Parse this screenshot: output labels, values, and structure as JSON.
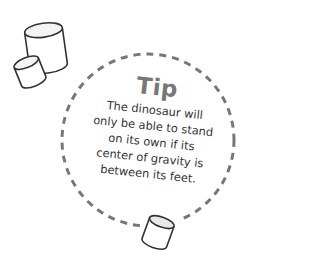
{
  "tip": {
    "title": "Tip",
    "lines": [
      "The dinosaur will",
      "only be able to stand",
      "on its own if its",
      "center of gravity is",
      "between its feet."
    ]
  },
  "colors": {
    "dashed_circle": "#777777",
    "title": "#777777",
    "body_text": "#333333",
    "outline": "#333333"
  },
  "icons": [
    "marshmallow-large",
    "marshmallow-small",
    "marshmallow-bottom"
  ]
}
